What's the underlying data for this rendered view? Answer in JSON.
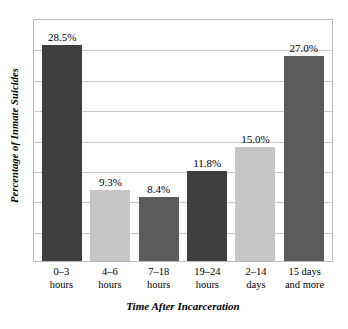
{
  "chart_data": {
    "type": "bar",
    "title": "",
    "xlabel": "Time After Incarceration",
    "ylabel": "Percentage of Inmate Suicides",
    "categories": [
      "0–3 hours",
      "4–6 hours",
      "7–18 hours",
      "19–24 hours",
      "2–14 days",
      "15 days and more"
    ],
    "category_lines": [
      [
        "0–3",
        "hours"
      ],
      [
        "4–6",
        "hours"
      ],
      [
        "7–18",
        "hours"
      ],
      [
        "19–24",
        "hours"
      ],
      [
        "2–14",
        "days"
      ],
      [
        "15 days",
        "and more"
      ]
    ],
    "values": [
      28.5,
      9.3,
      8.4,
      11.8,
      15.0,
      27.0
    ],
    "value_labels": [
      "28.5%",
      "9.3%",
      "8.4%",
      "11.8%",
      "15.0%",
      "27.0%"
    ],
    "bar_colors": [
      "#3f3f3f",
      "#c6c6c6",
      "#5b5b5b",
      "#3f3f3f",
      "#c6c6c6",
      "#5b5b5b"
    ],
    "ylim": [
      0,
      32
    ],
    "grid": true,
    "gridline_count": 7,
    "legend": "none",
    "frame_color": "#b9b9b9",
    "gridline_color": "#c9c9c9",
    "background": "#ffffff"
  }
}
